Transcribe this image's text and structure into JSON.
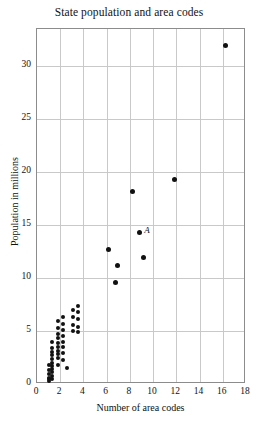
{
  "chart_data": {
    "type": "scatter",
    "title": "State population and area codes",
    "xlabel": "Number of area codes",
    "ylabel": "Population in millions",
    "xlim": [
      0,
      18
    ],
    "ylim": [
      0,
      33.5
    ],
    "xticks": [
      0,
      2,
      4,
      6,
      8,
      10,
      12,
      14,
      16,
      18
    ],
    "yticks": [
      0,
      5,
      10,
      15,
      20,
      25,
      30
    ],
    "grid": true,
    "legend": null,
    "annotations": [
      {
        "label": "A",
        "x": 8.8,
        "y": 14.3
      }
    ],
    "points": [
      {
        "x": 1.0,
        "y": 1.8
      },
      {
        "x": 1.0,
        "y": 1.3
      },
      {
        "x": 1.0,
        "y": 0.9
      },
      {
        "x": 1.0,
        "y": 0.6
      },
      {
        "x": 1.0,
        "y": 0.5
      },
      {
        "x": 1.0,
        "y": 0.3
      },
      {
        "x": 1.3,
        "y": 4.0
      },
      {
        "x": 1.3,
        "y": 3.4
      },
      {
        "x": 1.3,
        "y": 3.0
      },
      {
        "x": 1.3,
        "y": 2.7
      },
      {
        "x": 1.3,
        "y": 2.4
      },
      {
        "x": 1.3,
        "y": 2.0
      },
      {
        "x": 1.3,
        "y": 1.7
      },
      {
        "x": 1.3,
        "y": 1.4
      },
      {
        "x": 1.3,
        "y": 1.1
      },
      {
        "x": 1.3,
        "y": 0.8
      },
      {
        "x": 1.3,
        "y": 0.5
      },
      {
        "x": 1.8,
        "y": 5.9
      },
      {
        "x": 1.8,
        "y": 5.3
      },
      {
        "x": 1.8,
        "y": 4.7
      },
      {
        "x": 1.8,
        "y": 4.3
      },
      {
        "x": 1.8,
        "y": 3.9
      },
      {
        "x": 1.8,
        "y": 3.5
      },
      {
        "x": 1.8,
        "y": 3.1
      },
      {
        "x": 1.8,
        "y": 2.8
      },
      {
        "x": 1.8,
        "y": 2.5
      },
      {
        "x": 1.8,
        "y": 1.8
      },
      {
        "x": 2.2,
        "y": 6.3
      },
      {
        "x": 2.2,
        "y": 5.7
      },
      {
        "x": 2.2,
        "y": 5.1
      },
      {
        "x": 2.2,
        "y": 4.5
      },
      {
        "x": 2.2,
        "y": 4.0
      },
      {
        "x": 2.2,
        "y": 3.5
      },
      {
        "x": 2.2,
        "y": 2.9
      },
      {
        "x": 2.2,
        "y": 2.3
      },
      {
        "x": 2.6,
        "y": 1.5
      },
      {
        "x": 3.1,
        "y": 7.0
      },
      {
        "x": 3.1,
        "y": 6.3
      },
      {
        "x": 3.1,
        "y": 5.6
      },
      {
        "x": 3.1,
        "y": 5.0
      },
      {
        "x": 3.5,
        "y": 7.4
      },
      {
        "x": 3.5,
        "y": 6.8
      },
      {
        "x": 3.5,
        "y": 6.1
      },
      {
        "x": 3.5,
        "y": 5.4
      },
      {
        "x": 3.5,
        "y": 4.9
      },
      {
        "x": 6.2,
        "y": 12.7
      },
      {
        "x": 6.9,
        "y": 11.2
      },
      {
        "x": 6.8,
        "y": 9.6
      },
      {
        "x": 8.2,
        "y": 18.2
      },
      {
        "x": 8.8,
        "y": 14.3
      },
      {
        "x": 9.2,
        "y": 11.9
      },
      {
        "x": 11.8,
        "y": 19.3
      },
      {
        "x": 16.2,
        "y": 31.9
      }
    ]
  }
}
